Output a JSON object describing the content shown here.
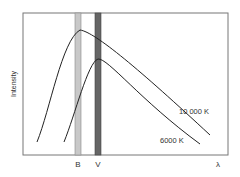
{
  "diagram": {
    "ylabel": "Intensity",
    "xlabel": "λ",
    "bands": [
      {
        "label": "B",
        "color": "#c8c8c8"
      },
      {
        "label": "V",
        "color": "#666666"
      }
    ],
    "curves": [
      {
        "label": "10 000 K"
      },
      {
        "label": "6000 K"
      }
    ]
  }
}
